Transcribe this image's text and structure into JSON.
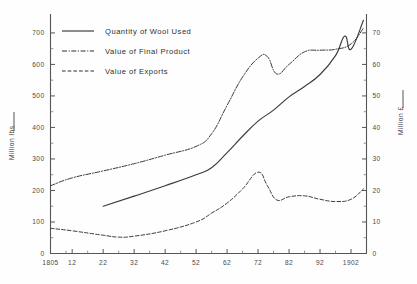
{
  "chart_data": {
    "type": "line",
    "title": "",
    "subtitle": "",
    "xlabel": "",
    "ylabel": "Million lbs",
    "y2label": "Million £",
    "grid": false,
    "legend_position": "top-left",
    "x_tick_labels": [
      "1805",
      "12",
      "22",
      "32",
      "42",
      "52",
      "62",
      "72",
      "82",
      "92",
      "1902"
    ],
    "x_tick_years": [
      1805,
      1812,
      1822,
      1832,
      1842,
      1852,
      1862,
      1872,
      1882,
      1892,
      1902
    ],
    "xlim": [
      1805,
      1907
    ],
    "y_tick_labels": [
      "0",
      "100",
      "200",
      "300",
      "400",
      "500",
      "600",
      "700"
    ],
    "y_tick_values": [
      0,
      100,
      200,
      300,
      400,
      500,
      600,
      700
    ],
    "ylim": [
      0,
      760
    ],
    "y2_tick_labels": [
      "0",
      "10",
      "20",
      "30",
      "40",
      "50",
      "60",
      "70"
    ],
    "y2_tick_values": [
      0,
      10,
      20,
      30,
      40,
      50,
      60,
      70
    ],
    "y2lim": [
      0,
      76
    ],
    "series": [
      {
        "name": "Quantity of Wool Used",
        "style": "solid",
        "axis": "left",
        "units": "Million lbs",
        "x": [
          1822,
          1832,
          1842,
          1852,
          1857,
          1862,
          1867,
          1872,
          1877,
          1882,
          1887,
          1892,
          1897,
          1900,
          1902,
          1906
        ],
        "values": [
          150,
          182,
          215,
          250,
          272,
          320,
          372,
          420,
          455,
          497,
          530,
          568,
          628,
          690,
          648,
          740
        ]
      },
      {
        "name": "Value of Final Product",
        "style": "dash-dot",
        "axis": "left",
        "units": "Million lbs",
        "x": [
          1805,
          1812,
          1822,
          1832,
          1842,
          1852,
          1857,
          1862,
          1867,
          1872,
          1875,
          1878,
          1882,
          1887,
          1892,
          1897,
          1902,
          1906
        ],
        "values": [
          215,
          240,
          262,
          285,
          312,
          340,
          380,
          470,
          560,
          620,
          625,
          570,
          600,
          640,
          645,
          648,
          665,
          715
        ]
      },
      {
        "name": "Value of Exports",
        "style": "dashed",
        "axis": "left",
        "units": "Million lbs",
        "x": [
          1805,
          1812,
          1822,
          1827,
          1832,
          1842,
          1852,
          1857,
          1862,
          1867,
          1872,
          1875,
          1878,
          1882,
          1887,
          1892,
          1897,
          1902,
          1906
        ],
        "values": [
          80,
          72,
          58,
          52,
          55,
          72,
          100,
          128,
          160,
          205,
          258,
          215,
          170,
          180,
          183,
          172,
          165,
          172,
          205
        ]
      }
    ]
  },
  "legend": {
    "entries": [
      {
        "label": "Quantity of  Wool Used",
        "style": "solid"
      },
      {
        "label": "Value of Final Product",
        "style": "dash-dot"
      },
      {
        "label": "Value of  Exports",
        "style": "dashed"
      }
    ]
  },
  "axes": {
    "left_title": "Million lbs",
    "right_title": "Million £"
  }
}
